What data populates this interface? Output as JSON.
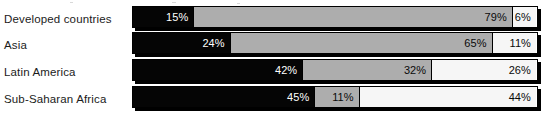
{
  "chart_data": {
    "type": "bar",
    "subtype": "stacked-horizontal-100-percent",
    "title": "",
    "xlabel": "",
    "ylabel": "",
    "xlim": [
      0,
      100
    ],
    "grid": false,
    "legend": "none",
    "value_suffix": "%",
    "categories": [
      "Developed countries",
      "Asia",
      "Latin America",
      "Sub-Saharan Africa"
    ],
    "series": [
      {
        "name": "segment-1",
        "color": "#050505",
        "values": [
          15,
          24,
          42,
          45
        ]
      },
      {
        "name": "segment-2",
        "color": "#adadad",
        "values": [
          79,
          65,
          32,
          11
        ]
      },
      {
        "name": "segment-3",
        "color": "#f6f6f6",
        "values": [
          6,
          11,
          26,
          44
        ]
      }
    ],
    "rows": [
      {
        "label": "Developed countries",
        "segments": [
          {
            "value": 15,
            "label": "15%",
            "shade": "dark"
          },
          {
            "value": 79,
            "label": "79%",
            "shade": "mid"
          },
          {
            "value": 6,
            "label": "6%",
            "shade": "light"
          }
        ]
      },
      {
        "label": "Asia",
        "segments": [
          {
            "value": 24,
            "label": "24%",
            "shade": "dark"
          },
          {
            "value": 65,
            "label": "65%",
            "shade": "mid"
          },
          {
            "value": 11,
            "label": "11%",
            "shade": "light"
          }
        ]
      },
      {
        "label": "Latin America",
        "segments": [
          {
            "value": 42,
            "label": "42%",
            "shade": "dark"
          },
          {
            "value": 32,
            "label": "32%",
            "shade": "mid"
          },
          {
            "value": 26,
            "label": "26%",
            "shade": "light"
          }
        ]
      },
      {
        "label": "Sub-Saharan Africa",
        "segments": [
          {
            "value": 45,
            "label": "45%",
            "shade": "dark"
          },
          {
            "value": 11,
            "label": "11%",
            "shade": "mid"
          },
          {
            "value": 44,
            "label": "44%",
            "shade": "light"
          }
        ]
      }
    ],
    "colors": {
      "dark": "#050505",
      "mid": "#adadad",
      "light": "#f6f6f6",
      "outline": "#000000",
      "background": "#ffffff",
      "label_text": "#1b1b1b"
    }
  }
}
